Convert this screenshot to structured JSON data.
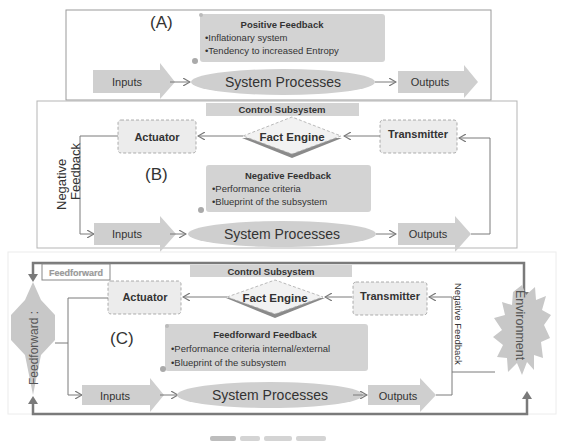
{
  "colors": {
    "shape_fill": "#cfcfcf",
    "panel_fill": "#d3d3d3",
    "line": "#7a7a7a",
    "frame": "#9a9a9a",
    "text": "#333333",
    "diamond_shadow": "#8a8a8a"
  },
  "panelA": {
    "label": "(A)",
    "feedback_box": {
      "title": "Positive Feedback",
      "items": [
        "•Inflationary system",
        "•Tendency to increased Entropy"
      ]
    },
    "inputs": "Inputs",
    "process": "System Processes",
    "outputs": "Outputs"
  },
  "panelB": {
    "label": "(B)",
    "control_subsystem": "Control Subsystem",
    "actuator": "Actuator",
    "fact_engine": "Fact Engine",
    "transmitter": "Transmitter",
    "side_label_line1": "Negative",
    "side_label_line2": "Feedback",
    "feedback_box": {
      "title": "Negative Feedback",
      "items": [
        "•Performance criteria",
        "•Blueprint of the subsystem"
      ]
    },
    "inputs": "Inputs",
    "process": "System Processes",
    "outputs": "Outputs"
  },
  "panelC": {
    "label": "(C)",
    "feedforward_tag": "Feedforward",
    "control_subsystem": "Control Subsystem",
    "actuator": "Actuator",
    "fact_engine": "Fact Engine",
    "transmitter": "Transmitter",
    "left_node": "Feedforward :",
    "right_node": "Environment",
    "negative_feedback_label": "Negative Feedback",
    "feedback_box": {
      "title": "Feedforward Feedback",
      "items": [
        "•Performance criteria internal/external",
        "•Blueprint of the subsystem"
      ]
    },
    "inputs": "Inputs",
    "process": "System Processes",
    "outputs": "Outputs"
  }
}
